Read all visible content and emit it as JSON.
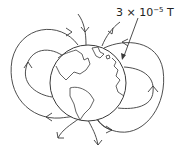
{
  "diagram": {
    "field_strength_label": {
      "mantissa": "3 × 10",
      "exponent": "−5",
      "unit": " T"
    },
    "elements": {
      "globe": "Earth with continents (Americas, Europe/Africa visible)",
      "field_lines": "closed loops on left and right sides; lines enter near north and exit near south",
      "annotation_arrow": "points from label to globe surface"
    },
    "colors": {
      "stroke": "#3a3a3a",
      "background": "#ffffff"
    }
  }
}
